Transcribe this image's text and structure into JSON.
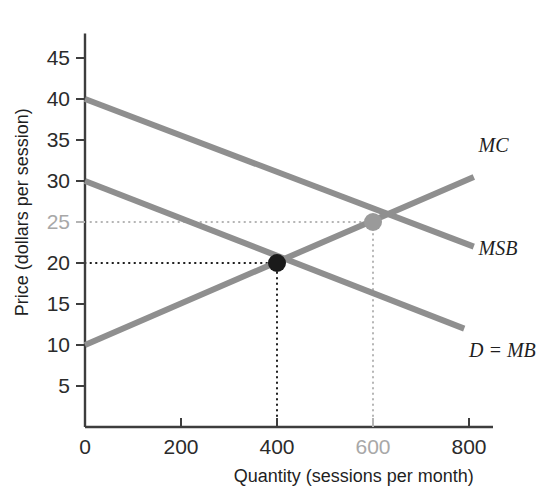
{
  "chart_data": {
    "type": "line",
    "title": "",
    "xlabel": "Quantity (sessions per month)",
    "ylabel": "Price (dollars per session)",
    "xlim": [
      0,
      850
    ],
    "ylim": [
      0,
      48
    ],
    "grid": false,
    "legend_position": "right-of-curve-ends",
    "xticks": [
      {
        "value": 0,
        "label": "0",
        "muted": false
      },
      {
        "value": 200,
        "label": "200",
        "muted": false
      },
      {
        "value": 400,
        "label": "400",
        "muted": false
      },
      {
        "value": 600,
        "label": "600",
        "muted": true
      },
      {
        "value": 800,
        "label": "800",
        "muted": false
      }
    ],
    "yticks": [
      {
        "value": 5,
        "label": "5",
        "muted": false
      },
      {
        "value": 10,
        "label": "10",
        "muted": false
      },
      {
        "value": 15,
        "label": "15",
        "muted": false
      },
      {
        "value": 20,
        "label": "20",
        "muted": false
      },
      {
        "value": 25,
        "label": "25",
        "muted": true
      },
      {
        "value": 30,
        "label": "30",
        "muted": false
      },
      {
        "value": 35,
        "label": "35",
        "muted": false
      },
      {
        "value": 40,
        "label": "40",
        "muted": false
      },
      {
        "value": 45,
        "label": "45",
        "muted": false
      }
    ],
    "series": [
      {
        "name": "MSB",
        "label": "MSB",
        "kind": "marginal-social-benefit",
        "x": [
          0,
          810
        ],
        "y": [
          40,
          22
        ],
        "color": "#8f8f8f",
        "label_x": 820,
        "label_y": 21
      },
      {
        "name": "D = MB",
        "label": "D = MB",
        "kind": "demand-marginal-benefit",
        "x": [
          0,
          790
        ],
        "y": [
          30,
          12
        ],
        "color": "#8f8f8f",
        "label_x": 800,
        "label_y": 8.5
      },
      {
        "name": "MC",
        "label": "MC",
        "kind": "marginal-cost",
        "x": [
          0,
          810
        ],
        "y": [
          10,
          30.5
        ],
        "color": "#8f8f8f",
        "label_x": 820,
        "label_y": 33.5
      }
    ],
    "points": [
      {
        "name": "private-equilibrium",
        "x": 400,
        "y": 20,
        "color": "#1a1a1a",
        "radius": 9,
        "intersection_of": [
          "D = MB",
          "MC"
        ]
      },
      {
        "name": "efficient-equilibrium",
        "x": 600,
        "y": 25,
        "color": "#9a9a9a",
        "radius": 9,
        "intersection_of": [
          "MSB",
          "MC"
        ]
      }
    ],
    "guidelines": [
      {
        "name": "price-25-guideline",
        "orientation": "horizontal",
        "value": 25,
        "from": 0,
        "to": 600,
        "color": "#b4b4b4"
      },
      {
        "name": "price-20-guideline",
        "orientation": "horizontal",
        "value": 20,
        "from": 0,
        "to": 400,
        "color": "#1a1a1a"
      },
      {
        "name": "quantity-400-guideline",
        "orientation": "vertical",
        "value": 400,
        "from": 0,
        "to": 20,
        "color": "#1a1a1a"
      },
      {
        "name": "quantity-600-guideline",
        "orientation": "vertical",
        "value": 600,
        "from": 0,
        "to": 25,
        "color": "#b4b4b4"
      }
    ],
    "axis_color": "#3d3d3d"
  }
}
